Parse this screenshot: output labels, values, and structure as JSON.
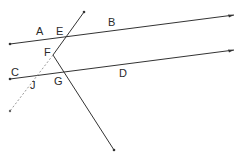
{
  "diagram": {
    "type": "geometry",
    "colors": {
      "line": "#333333",
      "dashed": "#999999",
      "label": "#2a2a2a",
      "background": "#ffffff"
    },
    "labels": {
      "A": "A",
      "B": "B",
      "C": "C",
      "D": "D",
      "E": "E",
      "F": "F",
      "G": "G",
      "J": "J"
    },
    "lines": [
      {
        "name": "line-AB",
        "from": [
          10,
          44
        ],
        "to": [
          234,
          15
        ],
        "style": "solid"
      },
      {
        "name": "line-CD",
        "from": [
          10,
          79
        ],
        "to": [
          234,
          50
        ],
        "style": "solid"
      },
      {
        "name": "segment-E-top-to-F",
        "from": [
          84,
          12
        ],
        "to": [
          53,
          55
        ],
        "style": "solid"
      },
      {
        "name": "segment-F-to-end",
        "from": [
          53,
          55
        ],
        "to": [
          114,
          150
        ],
        "style": "solid"
      },
      {
        "name": "segment-F-to-J-dashed",
        "from": [
          53,
          55
        ],
        "to": [
          10,
          111
        ],
        "style": "dashed"
      }
    ]
  }
}
